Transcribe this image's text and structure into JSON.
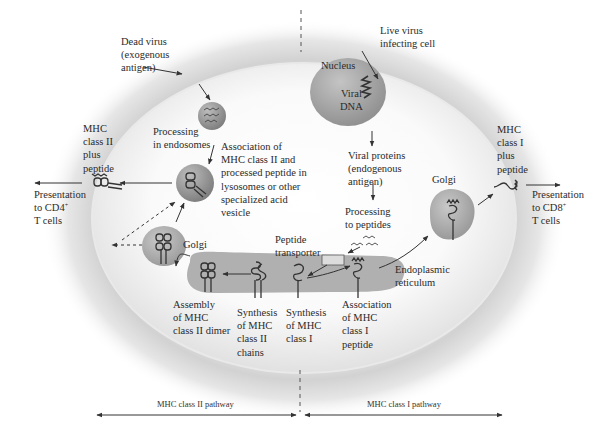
{
  "diagram": {
    "colors": {
      "background": "#ffffff",
      "cell_halo": "#c9c9c9",
      "cell_interior": "#f4f4f4",
      "membrane": "#e8e8e8",
      "organelle_fill": "#a9a9a9",
      "vesicle_fill": "#9a9a9a",
      "text": "#2b2b2b",
      "arrow": "#333333",
      "transporter": "#dcdcdc"
    },
    "labels": {
      "dead_virus": [
        "Dead virus",
        "(exogenous",
        "antigen)"
      ],
      "live_virus": [
        "Live virus",
        "infecting cell"
      ],
      "nucleus": "Nucleus",
      "viral_dna": [
        "Viral",
        "DNA"
      ],
      "processing_endosomes": [
        "Processing",
        "in endosomes"
      ],
      "association_class2": [
        "Association of",
        "MHC class II and",
        "processed peptide in",
        "lysosomes or other",
        "specialized acid",
        "vesicle"
      ],
      "mhc2_plus_peptide": [
        "MHC",
        "class II",
        "plus",
        "peptide"
      ],
      "presentation_cd4": [
        "Presentation",
        "to CD4",
        "T cells"
      ],
      "cd4_sup": "+",
      "golgi_left": "Golgi",
      "golgi_right": "Golgi",
      "viral_proteins": [
        "Viral proteins",
        "(endogenous",
        "antigen)"
      ],
      "processing_peptides": [
        "Processing",
        "to peptides"
      ],
      "peptide_transporter": [
        "Peptide",
        "transporter"
      ],
      "endoplasmic_reticulum": [
        "Endoplasmic",
        "reticulum"
      ],
      "assembly_class2": [
        "Assembly",
        "of MHC",
        "class II dimer"
      ],
      "synthesis_class2": [
        "Synthesis",
        "of MHC",
        "class II",
        "chains"
      ],
      "synthesis_class1": [
        "Synthesis",
        "of MHC",
        "class I"
      ],
      "association_class1": [
        "Association",
        "of MHC",
        "class I",
        "peptide"
      ],
      "mhc1_plus_peptide": [
        "MHC",
        "class I",
        "plus",
        "peptide"
      ],
      "presentation_cd8": [
        "Presentation",
        "to CD8",
        "T cells"
      ],
      "cd8_sup": "+"
    },
    "pathways": {
      "left": "MHC class II pathway",
      "right": "MHC class I pathway"
    }
  }
}
